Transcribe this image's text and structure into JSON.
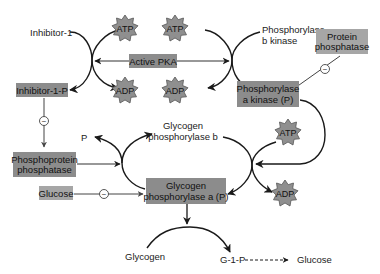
{
  "colors": {
    "box_fill": "#8c8c8c",
    "box_fill_light": "#a6a6a6",
    "star_fill": "#8f8f8f",
    "line": "#1a1a1a",
    "background": "#ffffff"
  },
  "labels": {
    "inhibitor1": "Inhibitor-1",
    "phosphorylase_b_kinase_line1": "Phosphorylase",
    "phosphorylase_b_kinase_line2": "b kinase",
    "p": "P",
    "glycogen_phosphorylase_b_line1": "Glycogen",
    "glycogen_phosphorylase_b_line2": "phosphorylase b",
    "glycogen": "Glycogen",
    "g1p": "G-1-P",
    "glucose_product": "Glucose"
  },
  "boxes": {
    "active_pka": "Active PKA",
    "inhibitor1p": "Inhibitor-1-P",
    "protein_phosphatase_line1": "Protein",
    "protein_phosphatase_line2": "phosphatase",
    "phosphorylase_a_kinase_line1": "Phosphorylase",
    "phosphorylase_a_kinase_line2": "a kinase (P)",
    "phosphoprotein_phosphatase_line1": "Phosphoprotein",
    "phosphoprotein_phosphatase_line2": "phosphatase",
    "glucose_inhibitor": "Glucose",
    "glycogen_phosphorylase_a_line1": "Glycogen",
    "glycogen_phosphorylase_a_line2": "phosphorylase a (P)"
  },
  "stars": {
    "atp1": "ATP",
    "atp2": "ATP",
    "adp1": "ADP",
    "adp2": "ADP",
    "atp3": "ATP",
    "adp3": "ADP"
  },
  "inhibition_symbol": "−"
}
